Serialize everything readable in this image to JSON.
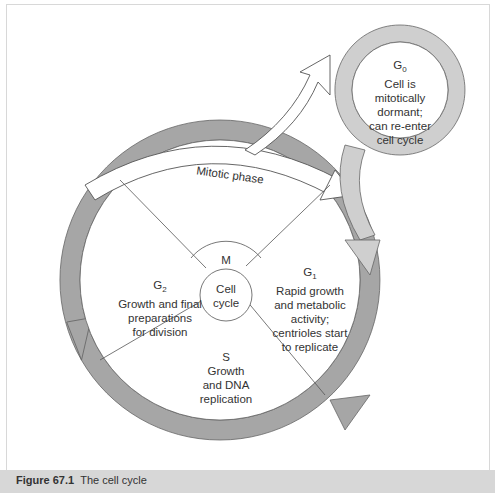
{
  "figure": {
    "number": "Figure 67.1",
    "title": "The cell cycle"
  },
  "diagram": {
    "center": "Cell cycle",
    "center_line1": "Cell",
    "center_line2": "cycle",
    "m_label": "M",
    "mitotic_phase": "Mitotic phase",
    "phases": {
      "g0": {
        "name": "G",
        "sub": "0",
        "lines": [
          "Cell is",
          "mitotically",
          "dormant;",
          "can re-enter",
          "cell cycle"
        ]
      },
      "g1": {
        "name": "G",
        "sub": "1",
        "lines": [
          "Rapid growth",
          "and metabolic",
          "activity;",
          "centrioles start",
          "to replicate"
        ]
      },
      "s": {
        "name": "S",
        "lines": [
          "Growth",
          "and DNA",
          "replication"
        ]
      },
      "g2": {
        "name": "G",
        "sub": "2",
        "lines": [
          "Growth and final",
          "preparations",
          "for division"
        ]
      }
    }
  },
  "colors": {
    "ring_dark": "#a3a3a3",
    "ring_light": "#cfcfcf",
    "stroke": "#555555",
    "caption_bg": "#d7d7d7"
  }
}
